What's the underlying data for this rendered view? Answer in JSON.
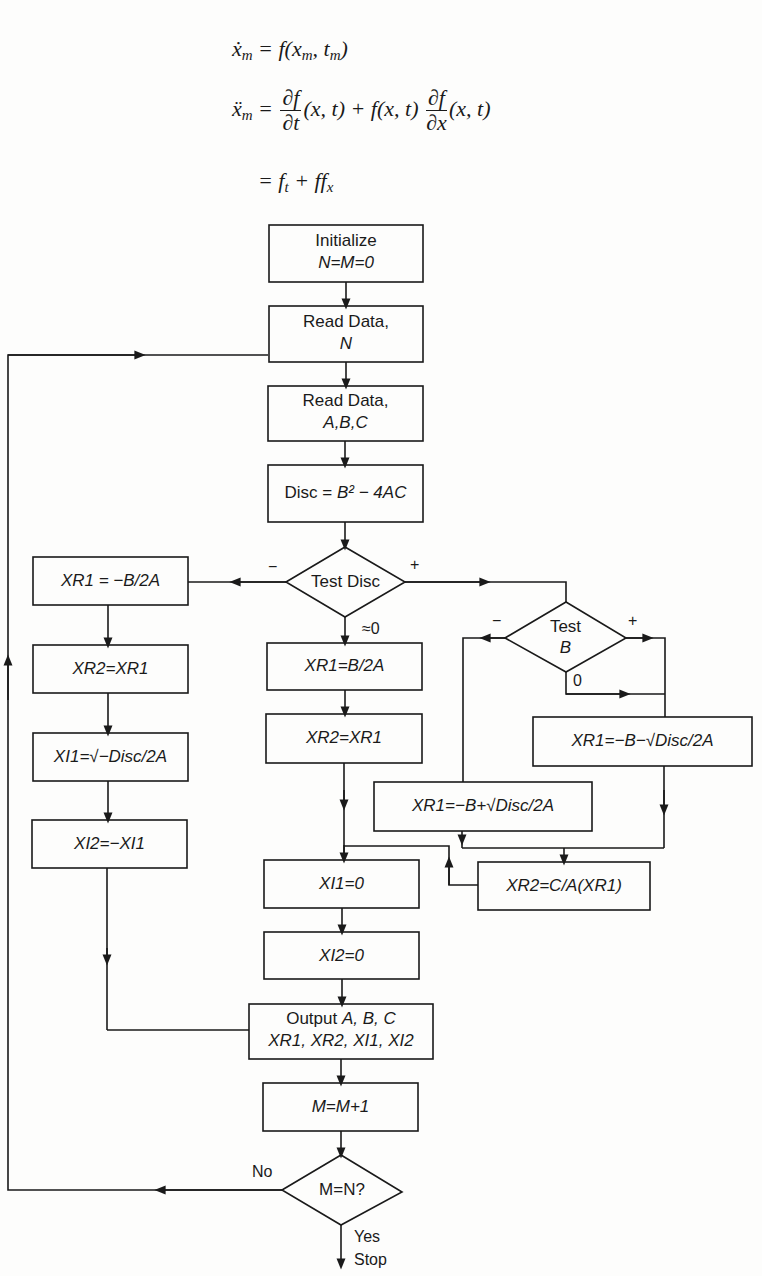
{
  "page_fragment": ") ,",
  "equations": {
    "eq1": {
      "lhs": "ẋ",
      "lhs_sub": "m",
      "rhs": "= f(x",
      "rhs_sub1": "m",
      "mid": ", t",
      "rhs_sub2": "m",
      "end": ")"
    },
    "eq2": {
      "lhs": "ẍ",
      "lhs_sub": "m",
      "eq": "=",
      "frac1_num": "∂f",
      "frac1_den": "∂t",
      "part1": "(x, t) + f(x, t)",
      "frac2_num": "∂f",
      "frac2_den": "∂x",
      "part2": "(x, t)"
    },
    "eq3": {
      "text": "= f",
      "sub1": "t",
      "mid": " + ff",
      "sub2": "x"
    }
  },
  "flowchart": {
    "boxes": {
      "initialize": {
        "line1": "Initialize",
        "line2": "N=M=0"
      },
      "read_n": {
        "line1": "Read Data,",
        "line2": "N"
      },
      "read_abc": {
        "line1": "Read Data,",
        "line2": "A,B,C"
      },
      "disc": {
        "prefix": "Disc = ",
        "formula": "B² − 4AC"
      },
      "neg_xr1": {
        "text": "XR1 = −B/2A"
      },
      "neg_xr2": {
        "text": "XR2=XR1"
      },
      "neg_xi1": {
        "text": "XI1=√−Disc/2A"
      },
      "neg_xi2": {
        "text": "XI2=−XI1"
      },
      "zero_xr1": {
        "text": "XR1=B/2A"
      },
      "zero_xr2": {
        "text": "XR2=XR1"
      },
      "pos_xr1_minus": {
        "text": "XR1=−B−√Disc/2A"
      },
      "pos_xr1_plus": {
        "text": "XR1=−B+√Disc/2A"
      },
      "pos_xr2": {
        "text": "XR2=C/A(XR1)"
      },
      "xi1_zero": {
        "text": "XI1=0"
      },
      "xi2_zero": {
        "text": "XI2=0"
      },
      "output": {
        "line1_prefix": "Output ",
        "line1_vars": "A, B, C",
        "line2": "XR1, XR2, XI1, XI2"
      },
      "increment": {
        "text": "M=M+1"
      }
    },
    "decisions": {
      "test_disc": {
        "label": "Test  Disc",
        "branch_neg": "−",
        "branch_pos": "+",
        "branch_zero": "≈0"
      },
      "test_b": {
        "line1": "Test",
        "line2": "B",
        "branch_neg": "−",
        "branch_pos": "+",
        "branch_zero": "0"
      },
      "m_eq_n": {
        "label": "M=N?",
        "branch_no": "No",
        "branch_yes": "Yes"
      }
    },
    "terminal": {
      "stop": "Stop"
    }
  }
}
